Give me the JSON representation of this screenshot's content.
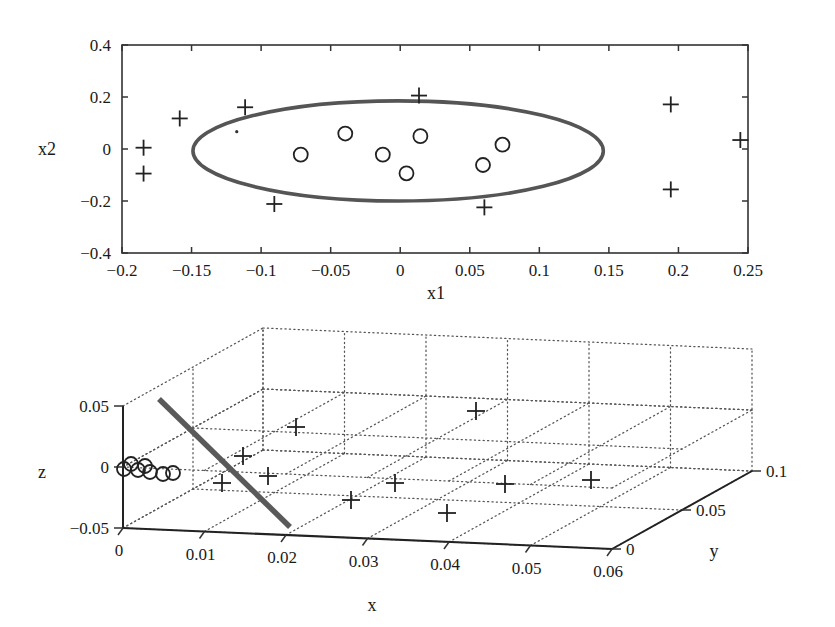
{
  "figure": {
    "background": "#ffffff",
    "ink_color": "#1a1a1a",
    "curve_color": "#555555"
  },
  "chart_data": [
    {
      "type": "scatter",
      "id": "top-2d-scatter",
      "title": "",
      "xlabel": "x1",
      "ylabel": "x2",
      "xlim": [
        -0.2,
        0.25
      ],
      "ylim": [
        -0.4,
        0.4
      ],
      "xticks": [
        "-0.2",
        "-0.15",
        "-0.1",
        "-0.05",
        "0",
        "0.05",
        "0.1",
        "0.15",
        "0.2",
        "0.25"
      ],
      "xtick_values": [
        -0.2,
        -0.15,
        -0.1,
        -0.05,
        0,
        0.05,
        0.1,
        0.15,
        0.2,
        0.25
      ],
      "yticks": [
        "-0.4",
        "-0.2",
        "0",
        "0.2",
        "0.4"
      ],
      "ytick_values": [
        -0.4,
        -0.2,
        0,
        0.2,
        0.4
      ],
      "grid": false,
      "legend": "none",
      "series": [
        {
          "name": "outliers",
          "marker": "plus",
          "points": [
            [
              -0.1845,
              0.005
            ],
            [
              -0.1845,
              -0.0945
            ],
            [
              -0.1585,
              0.1175
            ],
            [
              -0.1115,
              0.1605
            ],
            [
              -0.0905,
              -0.2115
            ],
            [
              0.0135,
              0.2055
            ],
            [
              0.0605,
              -0.2245
            ],
            [
              0.1945,
              0.1715
            ],
            [
              0.1945,
              -0.1555
            ],
            [
              0.2445,
              0.0345
            ]
          ]
        },
        {
          "name": "inliers",
          "marker": "circle",
          "points": [
            [
              -0.0715,
              -0.0215
            ],
            [
              -0.0395,
              0.0595
            ],
            [
              -0.0125,
              -0.0215
            ],
            [
              0.0045,
              -0.0935
            ],
            [
              0.0145,
              0.0495
            ],
            [
              0.0595,
              -0.0615
            ],
            [
              0.0735,
              0.0165
            ]
          ]
        },
        {
          "name": "stray-dot",
          "marker": "dot",
          "points": [
            [
              -0.1175,
              0.0665
            ]
          ]
        }
      ],
      "ellipse": {
        "name": "tolerance-ellipse",
        "center": [
          -0.0015,
          -0.0075
        ],
        "semi_axis_x": 0.1475,
        "semi_axis_y": 0.1925
      }
    },
    {
      "type": "scatter",
      "id": "bottom-3d-scatter",
      "title": "",
      "xlabel": "x",
      "ylabel": "y",
      "zlabel": "z",
      "xlim": [
        0,
        0.065
      ],
      "ylim": [
        0,
        0.1
      ],
      "zlim": [
        -0.05,
        0.05
      ],
      "xticks": [
        "0",
        "0.01",
        "0.02",
        "0.03",
        "0.04",
        "0.05",
        "0.06"
      ],
      "xtick_values": [
        0,
        0.01,
        0.02,
        0.03,
        0.04,
        0.05,
        0.06
      ],
      "yticks": [
        "0",
        "0.05",
        "0.1"
      ],
      "ytick_values": [
        0,
        0.05,
        0.1
      ],
      "zticks": [
        "-0.05",
        "0",
        "0.05"
      ],
      "ztick_values": [
        -0.05,
        0,
        0.05
      ],
      "grid": true,
      "grid_style": "dotted-box",
      "legend": "none",
      "series": [
        {
          "name": "outliers",
          "marker": "plus",
          "screen_points": [
            [
              296,
              427
            ],
            [
              243,
              456
            ],
            [
              222,
              483
            ],
            [
              268,
              476
            ],
            [
              351,
              500
            ],
            [
              395,
              483
            ],
            [
              447,
              513
            ],
            [
              476,
              411
            ],
            [
              505,
              484
            ],
            [
              591,
              480
            ]
          ]
        },
        {
          "name": "inliers-cluster",
          "marker": "circle",
          "screen_points": [
            [
              124,
              469
            ],
            [
              131,
              464
            ],
            [
              138,
              470
            ],
            [
              145,
              466
            ],
            [
              150,
              472
            ],
            [
              163,
              474
            ],
            [
              173,
              473
            ]
          ]
        }
      ],
      "thick_line": {
        "name": "projection-line",
        "from": [
          159,
          399
        ],
        "to": [
          290,
          527
        ]
      }
    }
  ],
  "labels": {
    "top_x_title": "x1",
    "top_y_title": "x2",
    "bottom_x_title": "x",
    "bottom_y_title": "y",
    "bottom_z_title": "z"
  }
}
